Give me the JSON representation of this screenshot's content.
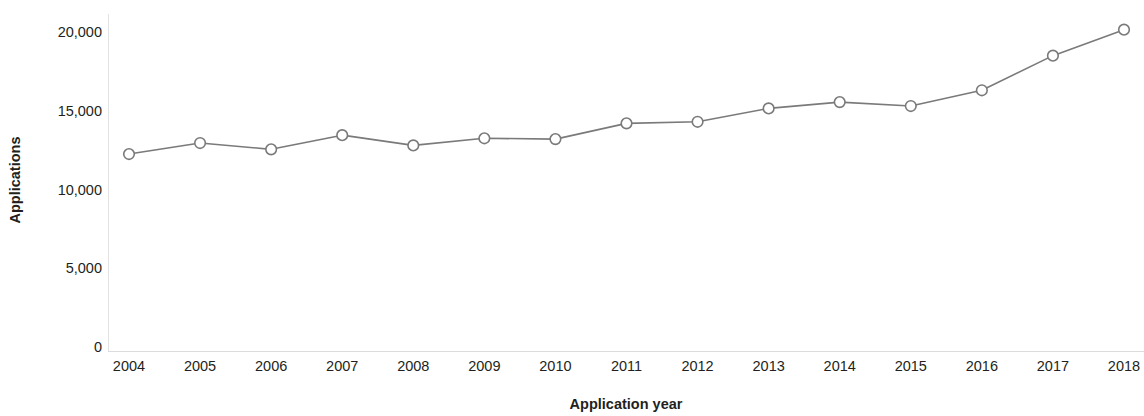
{
  "chart_data": {
    "type": "line",
    "title": "",
    "xlabel": "Application year",
    "ylabel": "Applications",
    "categories": [
      "2004",
      "2005",
      "2006",
      "2007",
      "2008",
      "2009",
      "2010",
      "2011",
      "2012",
      "2013",
      "2014",
      "2015",
      "2016",
      "2017",
      "2018"
    ],
    "values": [
      12250,
      12950,
      12550,
      13450,
      12800,
      13250,
      13200,
      14200,
      14300,
      15150,
      15550,
      15300,
      16300,
      18500,
      20150
    ],
    "series": [
      {
        "name": "Applications",
        "values": [
          12250,
          12950,
          12550,
          13450,
          12800,
          13250,
          13200,
          14200,
          14300,
          15150,
          15550,
          15300,
          16300,
          18500,
          20150
        ]
      }
    ],
    "x_tick_labels": [
      "2004",
      "2005",
      "2006",
      "2007",
      "2008",
      "2009",
      "2010",
      "2011",
      "2012",
      "2013",
      "2014",
      "2015",
      "2016",
      "2017",
      "2018"
    ],
    "y_tick_labels": [
      "0",
      "5,000",
      "10,000",
      "15,000",
      "20,000"
    ],
    "y_tick_values": [
      0,
      5000,
      10000,
      15000,
      20000
    ],
    "ylim": [
      0,
      21500
    ],
    "grid": false,
    "legend": "none",
    "marker": "open-circle",
    "line_color": "#7a7a7a",
    "marker_fill": "#ffffff",
    "axis_color": "#e2e2e4",
    "text_color": "#231f20"
  }
}
